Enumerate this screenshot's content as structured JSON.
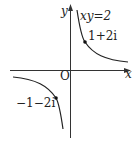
{
  "diagram": {
    "axes": {
      "x_label": "x",
      "y_label": "y",
      "origin_label": "O"
    },
    "curve": {
      "equation_label": "xy=2",
      "color": "#222222"
    },
    "points": [
      {
        "label": "1+2i",
        "x": 1,
        "y": 2
      },
      {
        "label": "−1−2i",
        "x": -1,
        "y": -2
      }
    ]
  }
}
